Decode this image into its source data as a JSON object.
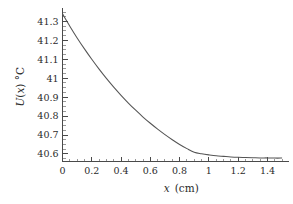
{
  "chart_data": {
    "type": "line",
    "title": "",
    "xlabel": "x (cm)",
    "xlabel_symbol": "x",
    "xlabel_unit": "(cm)",
    "ylabel": "U(x) °C",
    "ylabel_symbol": "U",
    "ylabel_arg": "(x)",
    "ylabel_unit": "°C",
    "xlim": [
      0,
      1.52
    ],
    "ylim": [
      40.56,
      41.35
    ],
    "grid": false,
    "legend": null,
    "line_color": "#555555",
    "axis_color": "#4a4a4a",
    "background": "#ffffff",
    "xticks": [
      0,
      0.2,
      0.4,
      0.6,
      0.8,
      1.0,
      1.2,
      1.4
    ],
    "xtick_labels": [
      "0",
      "0.2",
      "0.4",
      "0.6",
      "0.8",
      "1",
      "1.2",
      "1.4"
    ],
    "x_minor_step": 0.05,
    "yticks": [
      40.6,
      40.7,
      40.8,
      40.9,
      41.0,
      41.1,
      41.2,
      41.3
    ],
    "ytick_labels": [
      "40.6",
      "40.7",
      "40.8",
      "40.9",
      "41",
      "41.1",
      "41.2",
      "41.3"
    ],
    "y_minor_step": 0.025,
    "x": [
      0.0,
      0.05,
      0.1,
      0.15,
      0.2,
      0.25,
      0.3,
      0.35,
      0.4,
      0.45,
      0.5,
      0.55,
      0.6,
      0.65,
      0.7,
      0.75,
      0.8,
      0.85,
      0.9,
      0.95,
      1.0,
      1.05,
      1.1,
      1.15,
      1.2,
      1.25,
      1.3,
      1.35,
      1.4,
      1.45,
      1.5
    ],
    "y": [
      41.34,
      41.275,
      41.213,
      41.155,
      41.1,
      41.048,
      40.999,
      40.953,
      40.91,
      40.869,
      40.831,
      40.795,
      40.762,
      40.731,
      40.702,
      40.675,
      40.65,
      40.628,
      40.609,
      40.601,
      40.595,
      40.59,
      40.587,
      40.584,
      40.582,
      40.581,
      40.58,
      40.579,
      40.579,
      40.578,
      40.578
    ]
  }
}
